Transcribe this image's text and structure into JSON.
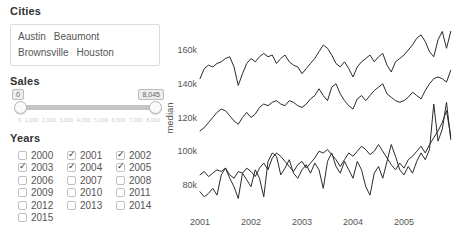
{
  "panel": {
    "cities": {
      "label": "Cities",
      "items": [
        "Austin",
        "Beaumont",
        "Brownsville",
        "Houston"
      ]
    },
    "sales": {
      "label": "Sales",
      "min_value": "0",
      "max_value": "8,045",
      "tick_labels": [
        "0",
        "1,000",
        "2,000",
        "3,000",
        "4,000",
        "5,000",
        "6,000",
        "7,000",
        "8,000"
      ]
    },
    "years": {
      "label": "Years",
      "items": [
        {
          "label": "2000",
          "checked": false
        },
        {
          "label": "2001",
          "checked": true
        },
        {
          "label": "2002",
          "checked": true
        },
        {
          "label": "2003",
          "checked": true
        },
        {
          "label": "2004",
          "checked": true
        },
        {
          "label": "2005",
          "checked": true
        },
        {
          "label": "2006",
          "checked": false
        },
        {
          "label": "2007",
          "checked": false
        },
        {
          "label": "2008",
          "checked": false
        },
        {
          "label": "2009",
          "checked": false
        },
        {
          "label": "2010",
          "checked": false
        },
        {
          "label": "2011",
          "checked": false
        },
        {
          "label": "2012",
          "checked": false
        },
        {
          "label": "2013",
          "checked": false
        },
        {
          "label": "2014",
          "checked": false
        },
        {
          "label": "2015",
          "checked": false
        }
      ]
    }
  },
  "chart_data": {
    "type": "line",
    "title": "",
    "xlabel": "",
    "ylabel": "median",
    "line_color": "#2a2a2a",
    "grid": false,
    "legend": "none",
    "ylim_thousands": [
      70,
      180
    ],
    "x_ticks": [
      {
        "month": 0,
        "label": "2001"
      },
      {
        "month": 12,
        "label": "2002"
      },
      {
        "month": 24,
        "label": "2003"
      },
      {
        "month": 36,
        "label": "2004"
      },
      {
        "month": 48,
        "label": "2005"
      }
    ],
    "y_ticks": [
      {
        "value": 80,
        "label": "80k"
      },
      {
        "value": 100,
        "label": "100k"
      },
      {
        "value": 120,
        "label": "120k"
      },
      {
        "value": 140,
        "label": "140k"
      },
      {
        "value": 160,
        "label": "160k"
      }
    ],
    "x_unit": "months from Jan 2001",
    "value_unit": "thousands",
    "series": [
      {
        "name": "line-1",
        "values": [
          143,
          149,
          151,
          150,
          152,
          153,
          155,
          156,
          150,
          139,
          146,
          152,
          155,
          153,
          156,
          158,
          156,
          157,
          152,
          155,
          157,
          153,
          151,
          150,
          146,
          149,
          152,
          155,
          159,
          163,
          161,
          157,
          152,
          150,
          153,
          149,
          144,
          150,
          153,
          155,
          157,
          153,
          156,
          158,
          151,
          147,
          153,
          155,
          157,
          160,
          163,
          167,
          169,
          165,
          159,
          156,
          166,
          171,
          161,
          171
        ]
      },
      {
        "name": "line-2",
        "values": [
          112,
          114,
          117,
          120,
          123,
          125,
          124,
          121,
          118,
          116,
          120,
          123,
          120,
          122,
          126,
          128,
          127,
          129,
          130,
          128,
          127,
          130,
          129,
          127,
          126,
          128,
          131,
          133,
          137,
          133,
          130,
          138,
          140,
          134,
          130,
          127,
          125,
          131,
          133,
          130,
          133,
          136,
          138,
          140,
          134,
          132,
          130,
          129,
          130,
          132,
          135,
          133,
          131,
          136,
          140,
          143,
          144,
          143,
          141,
          148
        ]
      },
      {
        "name": "line-3",
        "values": [
          86,
          88,
          85,
          87,
          89,
          88,
          90,
          86,
          84,
          88,
          87,
          90,
          88,
          85,
          90,
          93,
          89,
          96,
          99,
          97,
          94,
          91,
          88,
          92,
          94,
          90,
          93,
          96,
          100,
          99,
          101,
          98,
          95,
          91,
          95,
          99,
          97,
          100,
          103,
          101,
          98,
          100,
          104,
          100,
          96,
          92,
          89,
          93,
          90,
          95,
          97,
          100,
          103,
          99,
          104,
          108,
          112,
          117,
          124,
          109
        ]
      },
      {
        "name": "line-4",
        "values": [
          76,
          73,
          75,
          78,
          74,
          86,
          90,
          84,
          79,
          72,
          87,
          83,
          79,
          89,
          84,
          73,
          94,
          99,
          97,
          86,
          90,
          95,
          87,
          84,
          89,
          92,
          87,
          93,
          89,
          78,
          94,
          99,
          91,
          87,
          94,
          89,
          84,
          94,
          89,
          79,
          74,
          87,
          91,
          84,
          94,
          104,
          97,
          89,
          86,
          91,
          87,
          94,
          99,
          95,
          101,
          128,
          106,
          113,
          129,
          107
        ]
      }
    ]
  }
}
